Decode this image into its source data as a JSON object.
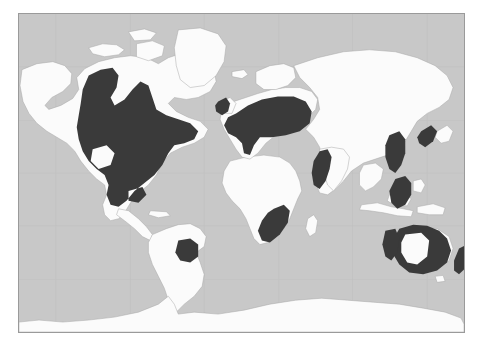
{
  "figure": {
    "type": "world-map",
    "projection": "equirectangular",
    "title": "",
    "caption": ""
  },
  "colors": {
    "ocean": "#c8c8c8",
    "land": "#fbfbfb",
    "highlight": "#3a3a3a",
    "border_line": "#9a9a9a",
    "country_outline": "#a8a8a8",
    "graticule": "#bdbdbd",
    "page_background": "#ffffff"
  },
  "legend": {
    "visible": false,
    "entries": [
      {
        "label": "Highlighted range",
        "color": "#3a3a3a"
      },
      {
        "label": "Other land",
        "color": "#fbfbfb"
      },
      {
        "label": "Ocean",
        "color": "#c8c8c8"
      }
    ]
  },
  "map": {
    "frame": {
      "x": 18,
      "y": 13,
      "width": 447,
      "height": 320
    },
    "graticule": {
      "visible": true,
      "meridian_spacing_deg": 30,
      "parallel_spacing_deg": 30
    },
    "highlighted_regions": [
      {
        "name": "north-america",
        "label": "United States and Canada",
        "holes": 2
      },
      {
        "name": "southern-south-america",
        "label": "Uruguay and northeast Argentina",
        "holes": 0
      },
      {
        "name": "europe",
        "label": "Central and Eastern Europe",
        "holes": 0
      },
      {
        "name": "british-isles",
        "label": "United Kingdom and Ireland",
        "holes": 0
      },
      {
        "name": "southern-africa",
        "label": "South Africa",
        "holes": 0
      },
      {
        "name": "india-west-coast",
        "label": "Western India",
        "holes": 0
      },
      {
        "name": "eastern-china",
        "label": "Eastern China",
        "holes": 0
      },
      {
        "name": "japan-korea",
        "label": "Japan and Korea",
        "holes": 0
      },
      {
        "name": "indochina-philippines",
        "label": "Indochina and Philippines",
        "holes": 0
      },
      {
        "name": "australia",
        "label": "Australia",
        "holes": 1
      },
      {
        "name": "new-zealand",
        "label": "New Zealand",
        "holes": 0
      }
    ],
    "unhighlighted_notes": [
      "Greenland and Arctic islands shown in land colour",
      "Antarctica shown in land colour along the bottom edge",
      "Africa north of the highlighted south shown in land colour"
    ]
  }
}
